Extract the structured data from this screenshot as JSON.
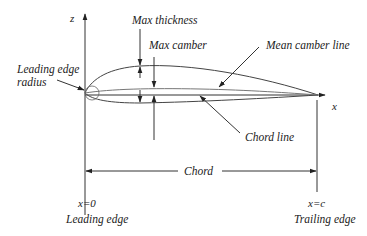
{
  "diagram": {
    "type": "airfoil-nomenclature",
    "axes": {
      "vertical_label": "z",
      "horizontal_label": "x"
    },
    "labels": {
      "max_thickness": "Max thickness",
      "max_camber": "Max camber",
      "mean_camber_line": "Mean camber line",
      "leading_edge_radius_line1": "Leading edge",
      "leading_edge_radius_line2": "radius",
      "chord_line": "Chord line",
      "chord": "Chord",
      "x0": "x=0",
      "leading_edge": "Leading edge",
      "xc": "x=c",
      "trailing_edge": "Trailing edge"
    },
    "colors": {
      "line": "#333333",
      "background": "#ffffff"
    }
  }
}
